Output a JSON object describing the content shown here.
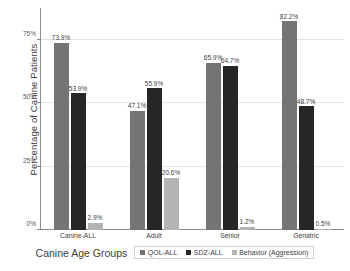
{
  "chart_data": {
    "type": "bar",
    "title": "",
    "subtitle": "",
    "xlabel": "Canine Age Groups",
    "ylabel": "Percentage of Canine Patients",
    "categories": [
      "Canine-ALL",
      "Adult",
      "Senior",
      "Geriatric"
    ],
    "series": [
      {
        "name": "QOL-ALL",
        "color": "#747474",
        "values": [
          73.9,
          47.1,
          65.9,
          82.2
        ],
        "labels": [
          "73.9%",
          "47.1%",
          "65.9%",
          "82.2%"
        ]
      },
      {
        "name": "SDZ-ALL",
        "color": "#262626",
        "values": [
          53.9,
          55.9,
          64.7,
          48.7
        ],
        "labels": [
          "53.9%",
          "55.9%",
          "64.7%",
          "48.7%"
        ]
      },
      {
        "name": "Behavior (Aggression)",
        "color": "#b3b3b3",
        "values": [
          2.9,
          20.6,
          1.2,
          0.5
        ],
        "labels": [
          "2.9%",
          "20.6%",
          "1.2%",
          "0.5%"
        ]
      }
    ],
    "ylim": [
      0,
      87.5
    ],
    "yticks": [
      0,
      25,
      50,
      75
    ],
    "ytick_labels": [
      "0%",
      "25%",
      "50%",
      "75%"
    ],
    "grid": "horizontal",
    "legend_position": "bottom-right"
  },
  "style": {
    "gridline_color": "#e2e2e2",
    "axis_color": "#8c8c8c",
    "text_color": "#3d3d3d",
    "background": "#ffffff"
  }
}
